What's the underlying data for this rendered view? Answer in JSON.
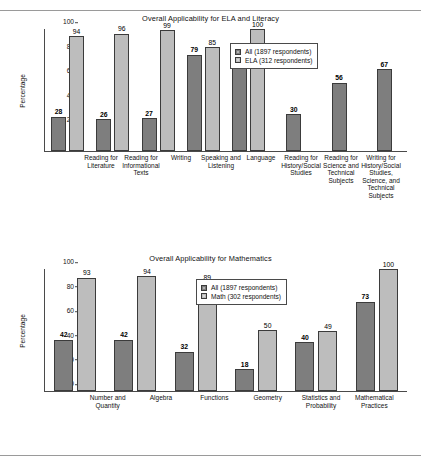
{
  "page": {
    "rules": [
      "top-rule",
      "bottom-rule"
    ]
  },
  "chart_data": [
    {
      "type": "bar",
      "title": "Overall Applicability for ELA and Literacy",
      "xlabel": "",
      "ylabel": "Percentage",
      "ylim": [
        0,
        100
      ],
      "yticks": [
        0,
        20,
        40,
        60,
        80,
        100
      ],
      "grid": false,
      "legend_position": "upper right",
      "categories": [
        "Reading for Literature",
        "Reading for Informational Texts",
        "Writing",
        "Speaking and Listening",
        "Language",
        "Reading for History/Social Studies",
        "Reading for Science and Technical Subjects",
        "Writing for History/Social Studies, Science, and Technical Subjects"
      ],
      "series": [
        {
          "name": "All (1897 respondents)",
          "color": "#7e7e7e",
          "values": [
            28,
            26,
            27,
            79,
            82,
            30,
            56,
            67
          ]
        },
        {
          "name": "ELA (312 respondents)",
          "color": "#bdbdbd",
          "values": [
            94,
            96,
            99,
            85,
            100,
            null,
            null,
            null
          ]
        }
      ]
    },
    {
      "type": "bar",
      "title": "Overall Applicability for Mathematics",
      "xlabel": "",
      "ylabel": "Percentage",
      "ylim": [
        0,
        100
      ],
      "yticks": [
        0,
        20,
        40,
        60,
        80,
        100
      ],
      "grid": false,
      "legend_position": "upper center",
      "categories": [
        "Number and Quantity",
        "Algebra",
        "Functions",
        "Geometry",
        "Statistics and Probability",
        "Mathematical Practices"
      ],
      "series": [
        {
          "name": "All (1897 respondents)",
          "color": "#7e7e7e",
          "values": [
            42,
            42,
            32,
            18,
            40,
            73
          ]
        },
        {
          "name": "Math (302 respondents)",
          "color": "#bdbdbd",
          "values": [
            93,
            94,
            89,
            50,
            49,
            100
          ]
        }
      ]
    }
  ]
}
